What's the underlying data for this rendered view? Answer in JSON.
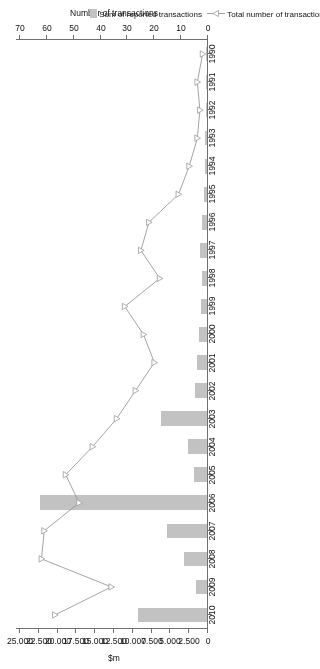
{
  "chart_data": {
    "type": "bar",
    "title": "",
    "orientation": "horizontal",
    "rotated_180": true,
    "categories": [
      "1990",
      "1991",
      "1992",
      "1993",
      "1994",
      "1995",
      "1996",
      "1997",
      "1998",
      "1999",
      "2000",
      "2001",
      "2002",
      "2003",
      "2004",
      "2005",
      "2006",
      "2007",
      "2008",
      "2009",
      "2010"
    ],
    "series": [
      {
        "name": "Sum of reported transactions",
        "type": "bar",
        "unit": "$m",
        "axis": "bottom",
        "values": [
          60,
          120,
          150,
          200,
          260,
          380,
          620,
          900,
          700,
          800,
          1100,
          1350,
          1600,
          6100,
          2550,
          1750,
          22200,
          5300,
          3000,
          1450,
          9200
        ]
      },
      {
        "name": "Total number of transactions",
        "type": "line",
        "unit": "transactions",
        "axis": "top",
        "marker": "open-triangle",
        "values": [
          2,
          4,
          3,
          4,
          7,
          11,
          22,
          25,
          18,
          31,
          24,
          20,
          27,
          34,
          43,
          53,
          48,
          61,
          62,
          36,
          57
        ]
      }
    ],
    "axes": {
      "top": {
        "label": "Number of transactions",
        "ticks": [
          0,
          10,
          20,
          30,
          40,
          50,
          60,
          70
        ],
        "min": 0,
        "max": 70,
        "direction": "right-to-left"
      },
      "bottom": {
        "label": "$m",
        "ticks": [
          "0",
          "2.500",
          "5.000",
          "7.500",
          "10.000",
          "12.500",
          "15.000",
          "17.500",
          "20.000",
          "22.500",
          "25.000"
        ],
        "tick_values": [
          0,
          2500,
          5000,
          7500,
          10000,
          12500,
          15000,
          17500,
          20000,
          22500,
          25000
        ],
        "min": 0,
        "max": 25000,
        "direction": "right-to-left"
      },
      "category": {
        "label": "",
        "ticks": [
          "1990",
          "1991",
          "1992",
          "1993",
          "1994",
          "1995",
          "1996",
          "1997",
          "1998",
          "1999",
          "2000",
          "2001",
          "2002",
          "2003",
          "2004",
          "2005",
          "2006",
          "2007",
          "2008",
          "2009",
          "2010"
        ]
      }
    },
    "legend": {
      "position": "bottom-right",
      "entries": [
        {
          "label": "Sum of reported transactions",
          "marker": "bar-swatch",
          "color": "#c2c2c2"
        },
        {
          "label": "Total number of transactions",
          "marker": "line-open-triangle",
          "color": "#9a9a9a"
        }
      ]
    },
    "grid": false,
    "colors": {
      "bar": "#c2c2c2",
      "line": "#9a9a9a",
      "axis": "#6f6f6f",
      "text": "#111111"
    }
  }
}
